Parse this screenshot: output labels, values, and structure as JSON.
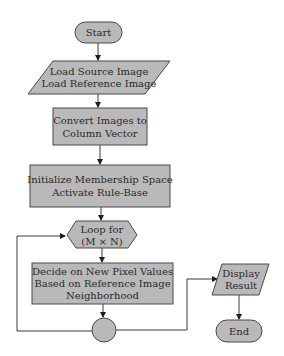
{
  "diagram": {
    "type": "flowchart",
    "colors": {
      "shape_fill": "#b9b9b9",
      "shape_stroke": "#4a4a4a",
      "line": "#3a3a3a",
      "text": "#2a2a2a",
      "background": "#ffffff"
    },
    "nodes": {
      "start": {
        "shape": "terminator",
        "lines": [
          "Start"
        ]
      },
      "load": {
        "shape": "parallelogram",
        "lines": [
          "Load Source Image",
          "Load Reference Image"
        ]
      },
      "convert": {
        "shape": "rectangle",
        "lines": [
          "Convert Images to",
          "Column Vector"
        ]
      },
      "init": {
        "shape": "rectangle",
        "lines": [
          "Initialize Membership Space",
          "Activate Rule-Base"
        ]
      },
      "loop": {
        "shape": "hexagon",
        "lines": [
          "Loop for",
          "(M × N)"
        ]
      },
      "decide": {
        "shape": "rectangle",
        "lines": [
          "Decide on New Pixel Values",
          "Based on Reference Image",
          "Neighborhood"
        ]
      },
      "connector": {
        "shape": "circle",
        "lines": []
      },
      "display": {
        "shape": "parallelogram",
        "lines": [
          "Display",
          "Result"
        ]
      },
      "end": {
        "shape": "terminator",
        "lines": [
          "End"
        ]
      }
    },
    "edges": [
      {
        "from": "start",
        "to": "load"
      },
      {
        "from": "load",
        "to": "convert"
      },
      {
        "from": "convert",
        "to": "init"
      },
      {
        "from": "init",
        "to": "loop"
      },
      {
        "from": "loop",
        "to": "decide"
      },
      {
        "from": "decide",
        "to": "connector"
      },
      {
        "from": "connector",
        "to": "loop",
        "label": "loop back"
      },
      {
        "from": "connector",
        "to": "display"
      },
      {
        "from": "display",
        "to": "end"
      }
    ]
  }
}
